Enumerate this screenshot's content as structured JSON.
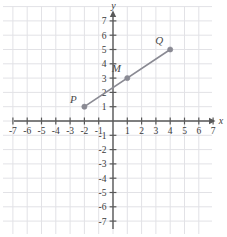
{
  "chart_data": {
    "type": "scatter",
    "title": "",
    "xlabel": "x",
    "ylabel": "y",
    "xlim": [
      -7.8,
      7.8
    ],
    "ylim": [
      -7.8,
      7.8
    ],
    "grid": true,
    "legend": null,
    "x_ticks": [
      "-7",
      "-6",
      "-5",
      "-4",
      "-3",
      "-2",
      "-1",
      "1",
      "2",
      "3",
      "4",
      "5",
      "6",
      "7"
    ],
    "x_tick_values": [
      -7,
      -6,
      -5,
      -4,
      -3,
      -2,
      -1,
      1,
      2,
      3,
      4,
      5,
      6,
      7
    ],
    "y_ticks": [
      "7",
      "6",
      "5",
      "4",
      "3",
      "2",
      "1",
      "-1",
      "-2",
      "-3",
      "-4",
      "-5",
      "-6",
      "-7"
    ],
    "y_tick_values": [
      7,
      6,
      5,
      4,
      3,
      2,
      1,
      -1,
      -2,
      -3,
      -4,
      -5,
      -6,
      -7
    ],
    "points": [
      {
        "label": "P",
        "x": -2,
        "y": 1,
        "label_dx": -11,
        "label_dy": -4
      },
      {
        "label": "M",
        "x": 1,
        "y": 3,
        "label_dx": -11,
        "label_dy": -6
      },
      {
        "label": "Q",
        "x": 4,
        "y": 5,
        "label_dx": -11,
        "label_dy": -6
      }
    ],
    "segments": [
      {
        "name": "PQ",
        "from": {
          "x": -2,
          "y": 1
        },
        "to": {
          "x": 4,
          "y": 5
        }
      }
    ]
  },
  "style": {
    "grid_color": "#e2e2e6",
    "axis_color": "#595959",
    "segment_color": "#8a8a93",
    "point_color": "#8a8a93",
    "text_color": "#3a3a3a",
    "background": "#ffffff"
  },
  "axes": {
    "x_axis_label": "x",
    "y_axis_label": "y"
  }
}
